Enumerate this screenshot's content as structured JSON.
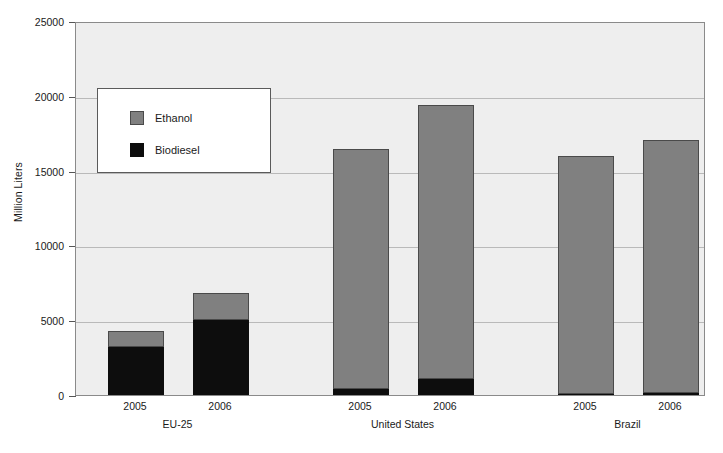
{
  "chart_data": {
    "type": "bar",
    "subtype": "stacked",
    "title": "",
    "xlabel": "",
    "ylabel": "Million Liters",
    "ylim": [
      0,
      25000
    ],
    "yticks": [
      0,
      5000,
      10000,
      15000,
      20000,
      25000
    ],
    "ytick_labels": [
      "0",
      "5000",
      "10000",
      "15000",
      "20000",
      "25000"
    ],
    "grid": true,
    "legend_position": "upper-left-inside",
    "groups": [
      {
        "label": "EU-25",
        "categories": [
          "2005",
          "2006"
        ]
      },
      {
        "label": "United States",
        "categories": [
          "2005",
          "2006"
        ]
      },
      {
        "label": "Brazil",
        "categories": [
          "2005",
          "2006"
        ]
      }
    ],
    "categories": [
      "2005",
      "2006",
      "2005",
      "2006",
      "2005",
      "2006"
    ],
    "series": [
      {
        "name": "Biodiesel",
        "color": "#0d0d0d",
        "values": [
          3200,
          5000,
          400,
          1080,
          100,
          150
        ]
      },
      {
        "name": "Ethanol",
        "color": "#808080",
        "values": [
          1100,
          1800,
          16050,
          18320,
          15900,
          16900
        ]
      }
    ],
    "totals": [
      4300,
      6800,
      16450,
      19400,
      16000,
      17050
    ],
    "bars": [
      {
        "group": "EU-25",
        "year": "2005",
        "biodiesel": 3200,
        "ethanol": 1100,
        "total": 4300
      },
      {
        "group": "EU-25",
        "year": "2006",
        "biodiesel": 5000,
        "ethanol": 1800,
        "total": 6800
      },
      {
        "group": "United States",
        "year": "2005",
        "biodiesel": 400,
        "ethanol": 16050,
        "total": 16450
      },
      {
        "group": "United States",
        "year": "2006",
        "biodiesel": 1080,
        "ethanol": 18320,
        "total": 19400
      },
      {
        "group": "Brazil",
        "year": "2005",
        "biodiesel": 100,
        "ethanol": 15900,
        "total": 16000
      },
      {
        "group": "Brazil",
        "year": "2006",
        "biodiesel": 150,
        "ethanol": 16900,
        "total": 17050
      }
    ]
  },
  "legend": {
    "items": [
      {
        "label": "Ethanol",
        "color": "#808080"
      },
      {
        "label": "Biodiesel",
        "color": "#0d0d0d"
      }
    ]
  },
  "axis": {
    "y_title": "Million Liters",
    "y_tick_0": "0",
    "y_tick_1": "5000",
    "y_tick_2": "10000",
    "y_tick_3": "15000",
    "y_tick_4": "20000",
    "y_tick_5": "25000"
  },
  "x_labels": {
    "eu_2005": "2005",
    "eu_2006": "2006",
    "us_2005": "2005",
    "us_2006": "2006",
    "br_2005": "2005",
    "br_2006": "2006"
  },
  "group_labels": {
    "eu": "EU-25",
    "us": "United States",
    "br": "Brazil"
  },
  "colors": {
    "ethanol": "#808080",
    "biodiesel": "#0d0d0d",
    "plot_background": "#eeeeee",
    "gridline": "#b9b9b9",
    "axis": "#555555"
  }
}
